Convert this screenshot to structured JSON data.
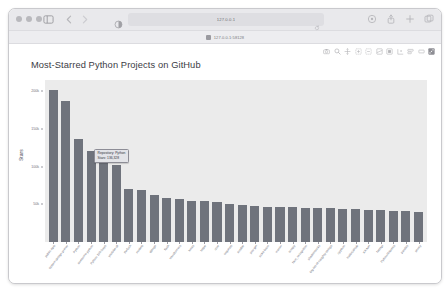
{
  "window": {
    "traffic_lights": [
      "close",
      "minimize",
      "zoom"
    ],
    "toolbar": {
      "sidebar_icon": "sidebar-icon",
      "back_icon": "chevron-left-icon",
      "forward_icon": "chevron-right-icon",
      "reader_icon": "reader-view-icon",
      "reload_icon": "reload-icon",
      "extensions_icon": "puzzle-icon",
      "share_icon": "share-icon",
      "new_tab_icon": "plus-icon",
      "tab_overview_icon": "tab-overview-icon"
    },
    "address_bar": {
      "url": "127.0.0.1",
      "placeholder": "Search or enter website name"
    },
    "bookmarks": [
      {
        "label": "127.0.0.1:58128",
        "favicon": "favicon"
      }
    ]
  },
  "modebar": {
    "icons": [
      "camera-icon",
      "zoom-icon",
      "pan-icon",
      "zoom-in-box-icon",
      "zoom-out-box-icon",
      "autoscale-icon",
      "reset-axes-icon",
      "spike-lines-icon",
      "hover-compare-icon",
      "hover-closest-icon",
      "plotly-logo-icon"
    ]
  },
  "tooltip": {
    "visible": true,
    "bar_index": 3,
    "lines": [
      "Repository: Python",
      "Stars: 136,328"
    ]
  },
  "chart_data": {
    "type": "bar",
    "title": "Most-Starred Python Projects on GitHub",
    "xlabel": "Repository",
    "ylabel": "Stars",
    "ylim": [
      0,
      215000
    ],
    "yticks": [
      50000,
      100000,
      150000,
      200000
    ],
    "ytick_labels": [
      "50k",
      "100k",
      "150k",
      "200k"
    ],
    "grid": false,
    "legend": "none",
    "bar_color": "#6f737c",
    "plot_bgcolor": "#ebebeb",
    "categories": [
      "public-apis",
      "system-design-primer",
      "Python",
      "awesome-python",
      "Python-100-Days",
      "youtube-dl",
      "thefuck",
      "models",
      "django",
      "flask",
      "transformers",
      "keras",
      "httpie",
      "core",
      "requests",
      "ansible",
      "you-get",
      "scikit-learn",
      "manim",
      "scrapy",
      "face_recognition",
      "shadowsocks",
      "big-list-of-naughty-strings",
      "cpython",
      "HelloGitHub",
      "XX-Net",
      "fastapi",
      "PythonRobotics",
      "pandas",
      "sentry"
    ],
    "values": [
      202000,
      187000,
      136328,
      121000,
      112000,
      102000,
      70000,
      69000,
      62000,
      58000,
      57000,
      55000,
      54000,
      53000,
      50000,
      49000,
      48000,
      47000,
      46500,
      46000,
      45500,
      45000,
      44500,
      44000,
      43500,
      43000,
      42000,
      41500,
      41000,
      40000
    ]
  }
}
